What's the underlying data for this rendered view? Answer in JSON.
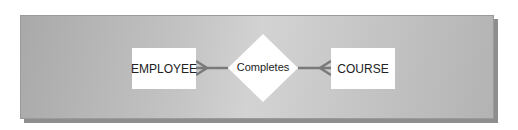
{
  "diagram": {
    "type": "entity-relationship",
    "entities": [
      {
        "name": "EMPLOYEE"
      },
      {
        "name": "COURSE"
      }
    ],
    "relationship": {
      "name": "Completes",
      "shape": "diamond"
    },
    "connectors": [
      {
        "from": "EMPLOYEE",
        "to": "Completes",
        "notation": "crow-foot-many"
      },
      {
        "from": "COURSE",
        "to": "Completes",
        "notation": "crow-foot-many"
      }
    ],
    "colors": {
      "panel": "#c4c4c4",
      "entity_fill": "#ffffff",
      "line": "#7a7a7a"
    }
  }
}
